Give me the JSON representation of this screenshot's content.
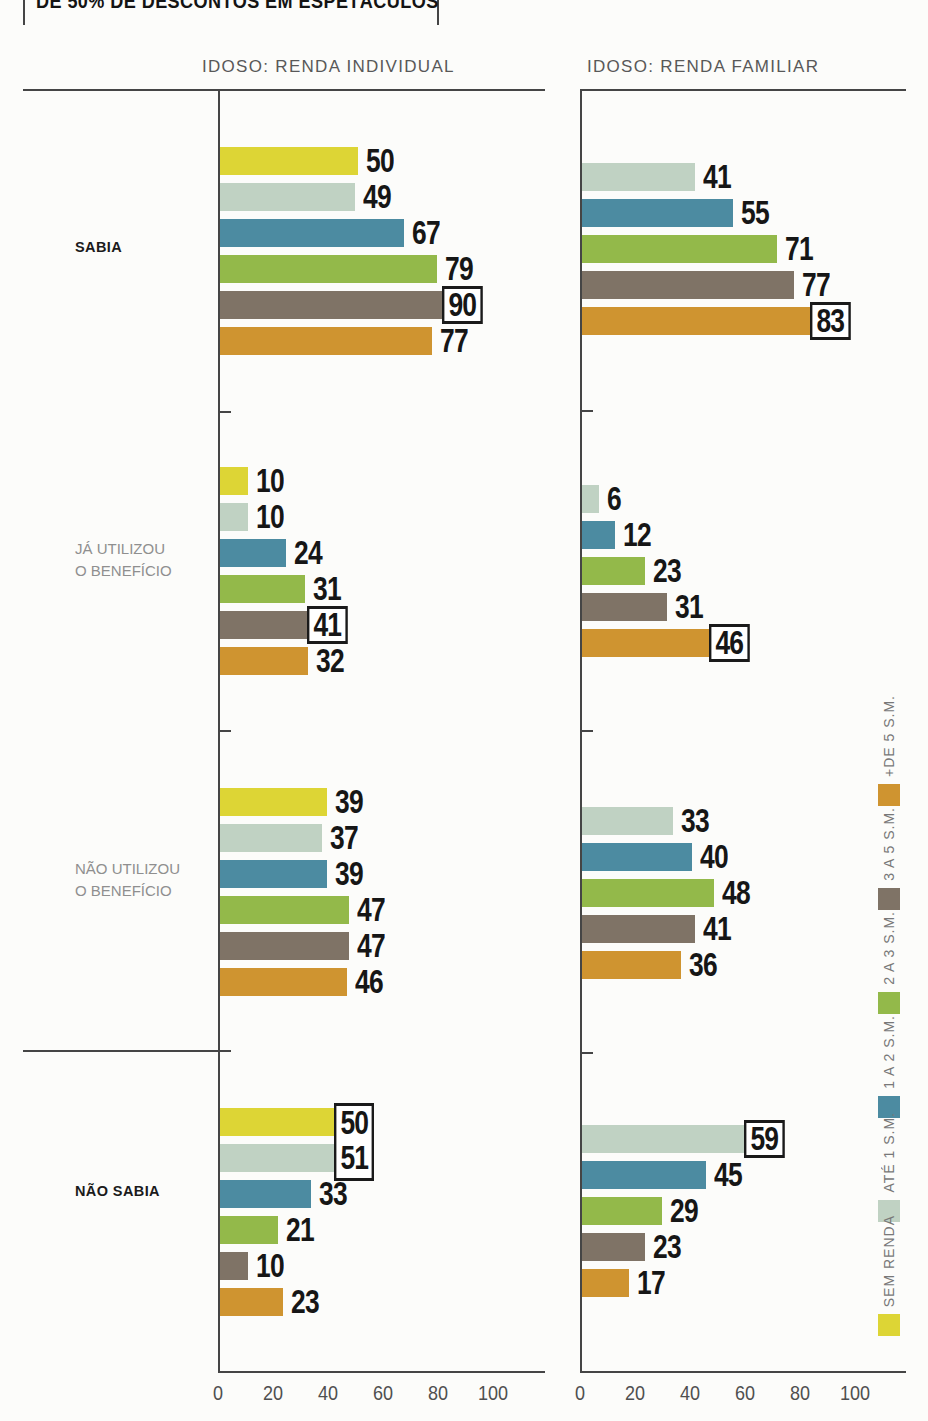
{
  "page": {
    "clipped_title": "DE 50% DE DESCONTOS EM ESPETÁCULOS"
  },
  "chart_data": {
    "type": "bar",
    "orientation": "horizontal",
    "xlim": [
      0,
      100
    ],
    "xticks": [
      0,
      20,
      40,
      60,
      80,
      100
    ],
    "grid": "off",
    "legend_position": "right-vertical",
    "legend": [
      {
        "label": "SEM RENDA",
        "color": "#ddd535"
      },
      {
        "label": "ATÉ 1 S.M.",
        "color": "#c0d2c3"
      },
      {
        "label": "1 A 2 S.M.",
        "color": "#4c8ba1"
      },
      {
        "label": "2 A 3 S.M.",
        "color": "#93b94a"
      },
      {
        "label": "3 A 5 S.M.",
        "color": "#7f7366"
      },
      {
        "label": "+DE 5 S.M.",
        "color": "#cf9430"
      }
    ],
    "row_categories": [
      {
        "label": "SABIA",
        "emphasis": "strong"
      },
      {
        "label": "JÁ UTILIZOU\nO BENEFÍCIO",
        "emphasis": "muted"
      },
      {
        "label": "NÃO UTILIZOU\nO BENEFÍCIO",
        "emphasis": "muted"
      },
      {
        "label": "NÃO SABIA",
        "emphasis": "strong"
      }
    ],
    "charts": [
      {
        "title": "IDOSO: RENDA INDIVIDUAL",
        "groups": [
          {
            "category": "SABIA",
            "bars": [
              {
                "series": "SEM RENDA",
                "value": 50
              },
              {
                "series": "ATÉ 1 S.M.",
                "value": 49
              },
              {
                "series": "1 A 2 S.M.",
                "value": 67
              },
              {
                "series": "2 A 3 S.M.",
                "value": 79
              },
              {
                "series": "3 A 5 S.M.",
                "value": 90,
                "highlight_box": "solo"
              },
              {
                "series": "+DE 5 S.M.",
                "value": 77
              }
            ]
          },
          {
            "category": "JÁ UTILIZOU O BENEFÍCIO",
            "bars": [
              {
                "series": "SEM RENDA",
                "value": 10
              },
              {
                "series": "ATÉ 1 S.M.",
                "value": 10
              },
              {
                "series": "1 A 2 S.M.",
                "value": 24
              },
              {
                "series": "2 A 3 S.M.",
                "value": 31
              },
              {
                "series": "3 A 5 S.M.",
                "value": 41,
                "highlight_box": "solo"
              },
              {
                "series": "+DE 5 S.M.",
                "value": 32
              }
            ]
          },
          {
            "category": "NÃO UTILIZOU O BENEFÍCIO",
            "bars": [
              {
                "series": "SEM RENDA",
                "value": 39
              },
              {
                "series": "ATÉ 1 S.M.",
                "value": 37
              },
              {
                "series": "1 A 2 S.M.",
                "value": 39
              },
              {
                "series": "2 A 3 S.M.",
                "value": 47
              },
              {
                "series": "3 A 5 S.M.",
                "value": 47
              },
              {
                "series": "+DE 5 S.M.",
                "value": 46
              }
            ]
          },
          {
            "category": "NÃO SABIA",
            "bars": [
              {
                "series": "SEM RENDA",
                "value": 50,
                "highlight_box": "top"
              },
              {
                "series": "ATÉ 1 S.M.",
                "value": 51,
                "highlight_box": "bottom"
              },
              {
                "series": "1 A 2 S.M.",
                "value": 33
              },
              {
                "series": "2 A 3 S.M.",
                "value": 21
              },
              {
                "series": "3 A 5 S.M.",
                "value": 10
              },
              {
                "series": "+DE 5 S.M.",
                "value": 23
              }
            ]
          }
        ]
      },
      {
        "title": "IDOSO: RENDA FAMILIAR",
        "groups": [
          {
            "category": "SABIA",
            "bars": [
              {
                "series": "ATÉ 1 S.M.",
                "value": 41
              },
              {
                "series": "1 A 2 S.M.",
                "value": 55
              },
              {
                "series": "2 A 3 S.M.",
                "value": 71
              },
              {
                "series": "3 A 5 S.M.",
                "value": 77
              },
              {
                "series": "+DE 5 S.M.",
                "value": 83,
                "highlight_box": "solo"
              }
            ]
          },
          {
            "category": "JÁ UTILIZOU O BENEFÍCIO",
            "bars": [
              {
                "series": "ATÉ 1 S.M.",
                "value": 6
              },
              {
                "series": "1 A 2 S.M.",
                "value": 12
              },
              {
                "series": "2 A 3 S.M.",
                "value": 23
              },
              {
                "series": "3 A 5 S.M.",
                "value": 31
              },
              {
                "series": "+DE 5 S.M.",
                "value": 46,
                "highlight_box": "solo"
              }
            ]
          },
          {
            "category": "NÃO UTILIZOU O BENEFÍCIO",
            "bars": [
              {
                "series": "ATÉ 1 S.M.",
                "value": 33
              },
              {
                "series": "1 A 2 S.M.",
                "value": 40
              },
              {
                "series": "2 A 3 S.M.",
                "value": 48
              },
              {
                "series": "3 A 5 S.M.",
                "value": 41
              },
              {
                "series": "+DE 5 S.M.",
                "value": 36
              }
            ]
          },
          {
            "category": "NÃO SABIA",
            "bars": [
              {
                "series": "ATÉ 1 S.M.",
                "value": 59,
                "highlight_box": "solo"
              },
              {
                "series": "1 A 2 S.M.",
                "value": 45
              },
              {
                "series": "2 A 3 S.M.",
                "value": 29
              },
              {
                "series": "3 A 5 S.M.",
                "value": 23
              },
              {
                "series": "+DE 5 S.M.",
                "value": 17
              }
            ]
          }
        ]
      }
    ]
  }
}
